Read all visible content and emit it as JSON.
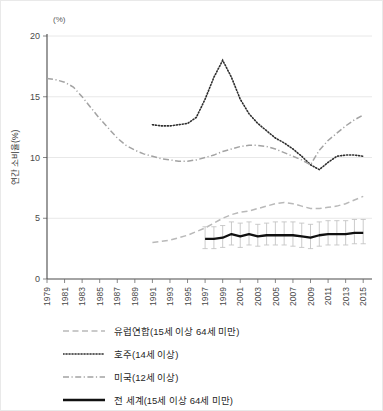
{
  "figure": {
    "cut_text_top": "· · · · · · · · · · · · · · · ·"
  },
  "chart_data": {
    "type": "line",
    "title": "",
    "xlabel": "",
    "ylabel": "연간 소비율(%)",
    "unit_label": "(%)",
    "ylim": [
      0,
      20
    ],
    "yticks": [
      0,
      5,
      10,
      15,
      20
    ],
    "xlim": [
      1979,
      2016
    ],
    "xticks": [
      1979,
      1981,
      1983,
      1985,
      1987,
      1989,
      1991,
      1993,
      1995,
      1997,
      1999,
      2001,
      2003,
      2005,
      2007,
      2009,
      2011,
      2013,
      2015
    ],
    "grid": "horizontal",
    "legend_position": "below",
    "series": [
      {
        "name": "유럽연합(15세 이상 64세 미만)",
        "style": "dashed",
        "color": "#b9b9b9",
        "x": [
          1991,
          1992,
          1993,
          1994,
          1995,
          1996,
          1997,
          1998,
          1999,
          2000,
          2001,
          2002,
          2003,
          2004,
          2005,
          2006,
          2007,
          2008,
          2009,
          2010,
          2011,
          2012,
          2013,
          2014,
          2015
        ],
        "y": [
          3.0,
          3.1,
          3.2,
          3.4,
          3.6,
          3.9,
          4.2,
          4.6,
          5.0,
          5.3,
          5.5,
          5.6,
          5.8,
          6.0,
          6.2,
          6.3,
          6.2,
          6.0,
          5.8,
          5.8,
          5.9,
          6.0,
          6.2,
          6.5,
          6.8
        ]
      },
      {
        "name": "호주(14세 이상)",
        "style": "dotted",
        "color": "#2e2e2e",
        "x": [
          1991,
          1992,
          1993,
          1994,
          1995,
          1996,
          1997,
          1998,
          1999,
          2000,
          2001,
          2002,
          2003,
          2004,
          2005,
          2006,
          2007,
          2008,
          2009,
          2010,
          2011,
          2012,
          2013,
          2014,
          2015
        ],
        "y": [
          12.7,
          12.6,
          12.6,
          12.7,
          12.8,
          13.3,
          14.8,
          16.6,
          18.0,
          16.6,
          14.8,
          13.6,
          12.8,
          12.2,
          11.6,
          11.2,
          10.7,
          10.1,
          9.4,
          9.0,
          9.6,
          10.1,
          10.2,
          10.2,
          10.1
        ]
      },
      {
        "name": "미국(12세 이상)",
        "style": "dash-dot",
        "color": "#a3a3a3",
        "x": [
          1979,
          1980,
          1981,
          1982,
          1983,
          1984,
          1985,
          1986,
          1987,
          1988,
          1989,
          1990,
          1991,
          1992,
          1993,
          1994,
          1995,
          1996,
          1997,
          1998,
          1999,
          2000,
          2001,
          2002,
          2003,
          2004,
          2005,
          2006,
          2007,
          2008,
          2009,
          2010,
          2011,
          2012,
          2013,
          2014,
          2015
        ],
        "y": [
          16.5,
          16.4,
          16.2,
          15.8,
          15.0,
          14.1,
          13.2,
          12.4,
          11.6,
          11.0,
          10.6,
          10.3,
          10.1,
          9.9,
          9.8,
          9.7,
          9.7,
          9.8,
          10.0,
          10.2,
          10.5,
          10.7,
          10.9,
          11.0,
          11.0,
          10.9,
          10.7,
          10.4,
          10.1,
          9.8,
          9.4,
          10.6,
          11.4,
          12.0,
          12.6,
          13.1,
          13.5
        ]
      },
      {
        "name": "전 세계(15세 이상 64세 미만)",
        "style": "solid",
        "color": "#111111",
        "x": [
          1997,
          1998,
          1999,
          2000,
          2001,
          2002,
          2003,
          2004,
          2005,
          2006,
          2007,
          2008,
          2009,
          2010,
          2011,
          2012,
          2013,
          2014,
          2015
        ],
        "y": [
          3.3,
          3.3,
          3.4,
          3.7,
          3.5,
          3.7,
          3.5,
          3.6,
          3.6,
          3.6,
          3.6,
          3.5,
          3.4,
          3.6,
          3.7,
          3.7,
          3.7,
          3.8,
          3.8
        ],
        "error_low": [
          2.5,
          2.5,
          2.6,
          2.8,
          2.6,
          2.8,
          2.7,
          2.8,
          2.8,
          2.8,
          2.7,
          2.6,
          2.5,
          2.7,
          2.8,
          2.8,
          2.8,
          2.9,
          2.9
        ],
        "error_high": [
          4.3,
          4.3,
          4.4,
          4.7,
          4.6,
          4.7,
          4.5,
          4.6,
          4.7,
          4.7,
          4.7,
          4.6,
          4.5,
          4.7,
          4.8,
          4.8,
          4.8,
          4.9,
          4.9
        ]
      }
    ]
  },
  "legend": {
    "items": [
      {
        "label": "유럽연합(15세 이상 64세 미만)",
        "style": "dashed"
      },
      {
        "label": "호주(14세 이상)",
        "style": "dotted"
      },
      {
        "label": "미국(12세 이상)",
        "style": "dash-dot"
      },
      {
        "label": "전 세계(15세 이상 64세 미만)",
        "style": "solid"
      }
    ]
  }
}
